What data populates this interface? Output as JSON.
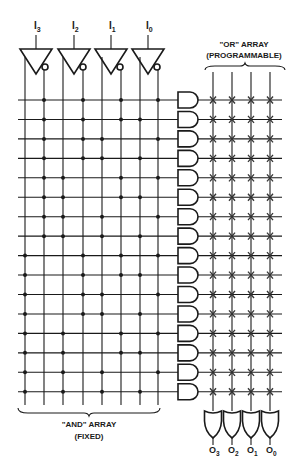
{
  "inputs": [
    {
      "name": "I",
      "sub": "3",
      "x": 36
    },
    {
      "name": "I",
      "sub": "2",
      "x": 74
    },
    {
      "name": "I",
      "sub": "1",
      "x": 111
    },
    {
      "name": "I",
      "sub": "0",
      "x": 148
    }
  ],
  "outputs": [
    {
      "name": "O",
      "sub": "3",
      "x": 213
    },
    {
      "name": "O",
      "sub": "2",
      "x": 232
    },
    {
      "name": "O",
      "sub": "1",
      "x": 251
    },
    {
      "name": "O",
      "sub": "0",
      "x": 270
    }
  ],
  "and_array": {
    "label_line1": "\"AND\" ARRAY",
    "label_line2": "(FIXED)",
    "columns_x": [
      25,
      44,
      63,
      83,
      102,
      121,
      140,
      158
    ],
    "rows_y_start": 100,
    "row_spacing": 19.45,
    "row_count": 16,
    "connections": [
      [
        1,
        3,
        5,
        7
      ],
      [
        1,
        3,
        5,
        6
      ],
      [
        1,
        3,
        4,
        7
      ],
      [
        1,
        3,
        4,
        6
      ],
      [
        1,
        2,
        5,
        7
      ],
      [
        1,
        2,
        5,
        6
      ],
      [
        1,
        2,
        4,
        7
      ],
      [
        1,
        2,
        4,
        6
      ],
      [
        0,
        3,
        5,
        7
      ],
      [
        0,
        3,
        5,
        6
      ],
      [
        0,
        3,
        4,
        7
      ],
      [
        0,
        3,
        4,
        6
      ],
      [
        0,
        2,
        5,
        7
      ],
      [
        0,
        2,
        5,
        6
      ],
      [
        0,
        2,
        4,
        7
      ],
      [
        0,
        2,
        4,
        6
      ]
    ]
  },
  "or_array": {
    "label_line1": "\"OR\" ARRAY",
    "label_line2": "(PROGRAMMABLE)",
    "columns_x": [
      213,
      232,
      251,
      270
    ],
    "fuse_symbol": "x"
  },
  "colors": {
    "ink": "#1a1a1a",
    "background": "#ffffff"
  }
}
